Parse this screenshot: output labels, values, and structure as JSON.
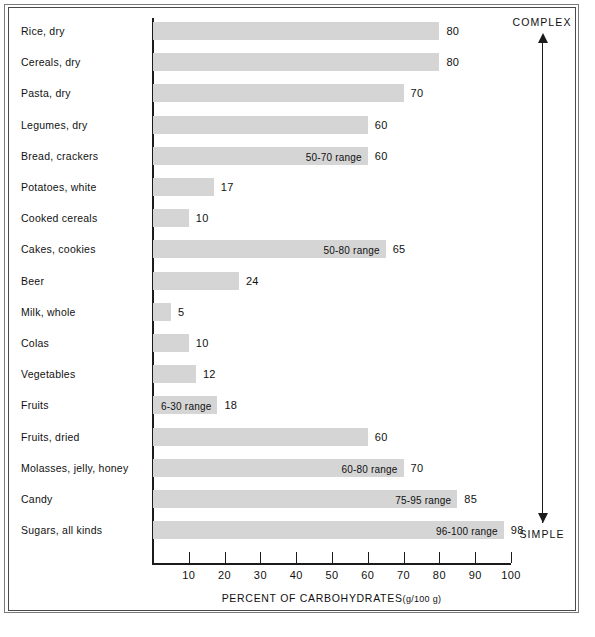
{
  "chart_data": {
    "type": "bar",
    "orientation": "horizontal",
    "title": "",
    "xlabel": "PERCENT OF CARBOHYDRATES",
    "xlabel_units": "(g/100 g)",
    "ylabel": "",
    "xlim": [
      0,
      100
    ],
    "xticks": [
      10,
      20,
      30,
      40,
      50,
      60,
      70,
      80,
      90,
      100
    ],
    "xtick_labels": [
      "10",
      "20",
      "30",
      "40",
      "50",
      "60",
      "70",
      "80",
      "90",
      "100"
    ],
    "grid": false,
    "legend": null,
    "bar_color": "#d5d5d5",
    "categories": [
      "Rice, dry",
      "Cereals, dry",
      "Pasta, dry",
      "Legumes, dry",
      "Bread, crackers",
      "Potatoes, white",
      "Cooked cereals",
      "Cakes, cookies",
      "Beer",
      "Milk, whole",
      "Colas",
      "Vegetables",
      "Fruits",
      "Fruits, dried",
      "Molasses, jelly, honey",
      "Candy",
      "Sugars, all kinds"
    ],
    "values": [
      80,
      80,
      70,
      60,
      60,
      17,
      10,
      65,
      24,
      5,
      10,
      12,
      18,
      60,
      70,
      85,
      98
    ],
    "value_labels": [
      "80",
      "80",
      "70",
      "60",
      "60",
      "17",
      "10",
      "65",
      "24",
      "5",
      "10",
      "12",
      "18",
      "60",
      "70",
      "85",
      "98"
    ],
    "range_labels": [
      "",
      "",
      "",
      "",
      "50-70 range",
      "",
      "",
      "50-80 range",
      "",
      "",
      "",
      "",
      "6-30 range",
      "",
      "60-80 range",
      "75-95 range",
      "96-100 range"
    ],
    "annotations": [
      {
        "text": "COMPLEX",
        "position": "top-right"
      },
      {
        "text": "SIMPLE",
        "position": "bottom-right"
      }
    ]
  },
  "rows": [
    {
      "label": "Rice, dry",
      "value": 80,
      "value_label": "80",
      "range_label": ""
    },
    {
      "label": "Cereals, dry",
      "value": 80,
      "value_label": "80",
      "range_label": ""
    },
    {
      "label": "Pasta, dry",
      "value": 70,
      "value_label": "70",
      "range_label": ""
    },
    {
      "label": "Legumes, dry",
      "value": 60,
      "value_label": "60",
      "range_label": ""
    },
    {
      "label": "Bread, crackers",
      "value": 60,
      "value_label": "60",
      "range_label": "50-70 range"
    },
    {
      "label": "Potatoes, white",
      "value": 17,
      "value_label": "17",
      "range_label": ""
    },
    {
      "label": "Cooked cereals",
      "value": 10,
      "value_label": "10",
      "range_label": ""
    },
    {
      "label": "Cakes, cookies",
      "value": 65,
      "value_label": "65",
      "range_label": "50-80 range"
    },
    {
      "label": "Beer",
      "value": 24,
      "value_label": "24",
      "range_label": ""
    },
    {
      "label": "Milk, whole",
      "value": 5,
      "value_label": "5",
      "range_label": ""
    },
    {
      "label": "Colas",
      "value": 10,
      "value_label": "10",
      "range_label": ""
    },
    {
      "label": "Vegetables",
      "value": 12,
      "value_label": "12",
      "range_label": ""
    },
    {
      "label": "Fruits",
      "value": 18,
      "value_label": "18",
      "range_label": "6-30 range"
    },
    {
      "label": "Fruits, dried",
      "value": 60,
      "value_label": "60",
      "range_label": ""
    },
    {
      "label": "Molasses, jelly, honey",
      "value": 70,
      "value_label": "70",
      "range_label": "60-80 range"
    },
    {
      "label": "Candy",
      "value": 85,
      "value_label": "85",
      "range_label": "75-95 range"
    },
    {
      "label": "Sugars, all kinds",
      "value": 98,
      "value_label": "98",
      "range_label": "96-100 range"
    }
  ],
  "axis": {
    "ticks": [
      "10",
      "20",
      "30",
      "40",
      "50",
      "60",
      "70",
      "80",
      "90",
      "100"
    ],
    "title": "PERCENT OF CARBOHYDRATES",
    "title_units": "(g/100 g)"
  },
  "annotation": {
    "top": "COMPLEX",
    "bottom": "SIMPLE"
  }
}
